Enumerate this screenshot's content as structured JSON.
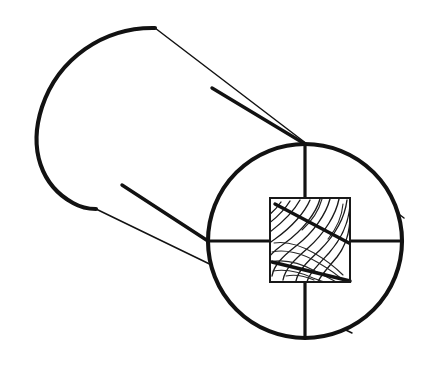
{
  "figure": {
    "kind": "line-drawing",
    "canvas": {
      "width": 431,
      "height": 374,
      "background": "#ffffff"
    },
    "ink_color": "#121212",
    "caption": ""
  },
  "geometry": {
    "end_circle": {
      "name": "log-end-face",
      "center_x": 305,
      "center_y": 241,
      "radius": 97,
      "stroke_width": 4.1
    },
    "far_end_arc": {
      "name": "log-far-end",
      "description": "rounded far end cap of the cylinder",
      "left_extreme_x": 38,
      "top_point_x": 155,
      "top_point_y": 28,
      "bottom_point_x": 96,
      "bottom_point_y": 209,
      "stroke_width": 4.1
    },
    "top_silhouette": {
      "name": "cylinder-top-edge",
      "x1": 155,
      "y1": 28,
      "x2": 404,
      "y2": 218,
      "stroke_width": 1.5
    },
    "bottom_silhouette": {
      "name": "cylinder-bottom-edge",
      "x1": 96,
      "y1": 209,
      "x2": 352,
      "y2": 333,
      "stroke_width": 1.5
    },
    "cross_vertical": {
      "name": "end-face-vertical-axis",
      "x1": 305,
      "y1": 144,
      "x2": 305,
      "y2": 338,
      "stroke_width": 3.2
    },
    "cross_horizontal": {
      "name": "end-face-horizontal-axis",
      "x1": 208,
      "y1": 241,
      "x2": 402,
      "y2": 241,
      "stroke_width": 3.2
    },
    "square": {
      "name": "timber-cross-section",
      "left": 270,
      "top": 198,
      "right": 350,
      "bottom": 282,
      "stroke_width": 2.0
    },
    "timber_edge_upper": {
      "name": "timber-top-edge-line",
      "x1": 212,
      "y1": 88,
      "x2": 305,
      "y2": 144,
      "stroke_width": 3.4
    },
    "timber_edge_lower": {
      "name": "timber-bottom-edge-line",
      "x1": 122,
      "y1": 185,
      "x2": 208,
      "y2": 241,
      "stroke_width": 3.4
    },
    "timber_diagonal_upper": {
      "name": "timber-diagonal-upper",
      "x1": 275,
      "y1": 204,
      "x2": 349,
      "y2": 243,
      "stroke_width": 3.4
    },
    "timber_diagonal_lower": {
      "name": "timber-diagonal-lower",
      "x1": 272,
      "y1": 262,
      "x2": 350,
      "y2": 281,
      "stroke_width": 3.4
    },
    "grain_pattern": {
      "name": "wood-grain-lines",
      "description": "curved annual-ring arcs filling the square section",
      "line_count": 17
    }
  },
  "labels": {
    "none_visible": true
  }
}
